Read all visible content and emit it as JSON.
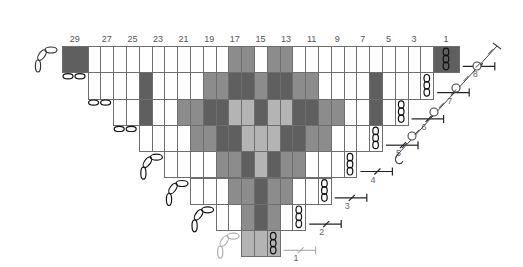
{
  "chart_title": "",
  "colors": {
    "W": "#ffffff",
    "M": "#8c8c8c",
    "D": "#5f5f5f",
    "L": "#b4b4b4",
    "grid": "#6e6e6e",
    "ink": "#222222",
    "faint": "#b0b0b0"
  },
  "grid": {
    "x0": 62,
    "y0": 46,
    "col_w": 12.8,
    "row_h": 26.3
  },
  "column_labels": [
    {
      "text": "29",
      "i": 0.5
    },
    {
      "text": "27",
      "i": 3
    },
    {
      "text": "25",
      "i": 5
    },
    {
      "text": "23",
      "i": 7
    },
    {
      "text": "21",
      "i": 9
    },
    {
      "text": "19",
      "i": 11
    },
    {
      "text": "17",
      "i": 13
    },
    {
      "text": "15",
      "i": 15
    },
    {
      "text": "13",
      "i": 17
    },
    {
      "text": "11",
      "i": 19
    },
    {
      "text": "9",
      "i": 21
    },
    {
      "text": "7",
      "i": 23
    },
    {
      "text": "5",
      "i": 25
    },
    {
      "text": "3",
      "i": 27
    },
    {
      "text": "1",
      "i": 29.5
    }
  ],
  "rows": [
    {
      "label": "8",
      "start": 0,
      "cells": "DDWWWWWWWWWWWMMWMMWWWWWWWWWWWDD",
      "chain_at": 29,
      "chain_double": true
    },
    {
      "label": "7",
      "start": 2,
      "cells": "WWWWDWWWWMMDDMDDMMWWWWDWWWW",
      "chain_at": 28
    },
    {
      "label": "6",
      "start": 4,
      "cells": "WWDWWMMDDLLDLLDDMMWWDWW",
      "chain_at": 26
    },
    {
      "label": "5",
      "start": 6,
      "cells": "WWWWMMDDLLLDDMMWWWW",
      "chain_at": 24
    },
    {
      "label": "4",
      "start": 8,
      "cells": "WWWWMMDLDMMWWWW",
      "chain_at": 22
    },
    {
      "label": "3",
      "start": 10,
      "cells": "WWWMMDMMWWW",
      "chain_at": 20
    },
    {
      "label": "2",
      "start": 12,
      "cells": "WWMDMWW",
      "chain_at": 18
    },
    {
      "label": "1",
      "start": 14,
      "cells": "LLL",
      "chain_at": 16,
      "faint": true
    }
  ],
  "legend_symbols": {
    "chain": "chain-stitch",
    "turning_chain": "turning-chain",
    "fasten_off": "fasten-off-marker",
    "slip_stitch_edge": "slip-stitch-edge"
  }
}
